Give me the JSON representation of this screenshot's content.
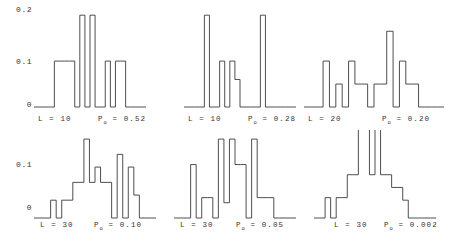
{
  "figure": {
    "background": "#ffffff",
    "line_color": "#3a3a3a",
    "rows": 2,
    "cols": 3
  },
  "axis": {
    "top_row_ticks": [
      "0.2",
      "0.1",
      "0"
    ],
    "bottom_row_ticks": [
      "0.1",
      "0"
    ]
  },
  "chart_data": {
    "type": "bar",
    "title": "",
    "xlabel": "",
    "ylabel": "",
    "grid": false,
    "legend": "none",
    "note": "Six step-histogram panels (2 rows x 3 columns) of a probability distribution; y axis shared per row, drawn as outline step curves.",
    "panels": [
      {
        "id": "panel-1",
        "position": "top-left",
        "L_label": "L = 10",
        "P_label": "P",
        "P_sub": "o",
        "P_value": "= 0.52",
        "ylim": [
          0,
          0.22
        ],
        "yticks": [
          0,
          0.1,
          0.2
        ],
        "nbins": 22,
        "values": [
          0,
          0,
          0,
          0,
          0.1,
          0.1,
          0.1,
          0.1,
          0,
          0.2,
          0,
          0.2,
          0,
          0,
          0.1,
          0,
          0.1,
          0.1,
          0,
          0,
          0,
          0
        ]
      },
      {
        "id": "panel-2",
        "position": "top-middle",
        "L_label": "L = 10",
        "P_label": "P",
        "P_sub": "o",
        "P_value": "= 0.28",
        "ylim": [
          0,
          0.22
        ],
        "yticks": [
          0,
          0.1,
          0.2
        ],
        "nbins": 22,
        "values": [
          0,
          0,
          0,
          0,
          0.2,
          0,
          0,
          0.1,
          0,
          0.1,
          0.06,
          0,
          0,
          0,
          0,
          0.2,
          0,
          0,
          0,
          0,
          0,
          0
        ]
      },
      {
        "id": "panel-3",
        "position": "top-right",
        "L_label": "L = 20",
        "P_label": "P",
        "P_sub": "o",
        "P_value": "= 0.20",
        "ylim": [
          0,
          0.22
        ],
        "yticks": [
          0,
          0.1,
          0.2
        ],
        "nbins": 22,
        "values": [
          0,
          0,
          0,
          0.1,
          0,
          0.05,
          0,
          0.1,
          0.05,
          0.05,
          0,
          0.05,
          0.05,
          0.165,
          0,
          0.1,
          0.05,
          0.05,
          0,
          0,
          0,
          0
        ]
      },
      {
        "id": "panel-4",
        "position": "bottom-left",
        "L_label": "L = 30",
        "P_label": "P",
        "P_sub": "o",
        "P_value": "= 0.10",
        "ylim": [
          0,
          0.165
        ],
        "yticks": [
          0,
          0.1
        ],
        "nbins": 22,
        "values": [
          0,
          0,
          0,
          0.035,
          0,
          0.035,
          0.035,
          0.07,
          0.07,
          0.155,
          0.07,
          0.1,
          0.07,
          0.07,
          0,
          0.125,
          0,
          0.1,
          0.045,
          0,
          0,
          0
        ]
      },
      {
        "id": "panel-5",
        "position": "bottom-middle",
        "L_label": "L = 30",
        "P_label": "P",
        "P_sub": "o",
        "P_value": "= 0.05",
        "ylim": [
          0,
          0.165
        ],
        "yticks": [
          0,
          0.1
        ],
        "nbins": 22,
        "values": [
          0,
          0,
          0,
          0.105,
          0,
          0.04,
          0.04,
          0,
          0.155,
          0.03,
          0.155,
          0.105,
          0.105,
          0,
          0.155,
          0.04,
          0.04,
          0.04,
          0,
          0,
          0,
          0
        ]
      },
      {
        "id": "panel-6",
        "position": "bottom-right",
        "L_label": "L = 30",
        "P_label": "P",
        "P_sub": "o",
        "P_value": "= 0.002",
        "ylim": [
          0,
          0.165
        ],
        "yticks": [
          0,
          0.1
        ],
        "nbins": 22,
        "values": [
          0,
          0,
          0.04,
          0,
          0.04,
          0.04,
          0.085,
          0.085,
          0.24,
          0.24,
          0.085,
          0.22,
          0.085,
          0.085,
          0.06,
          0.06,
          0.035,
          0,
          0,
          0,
          0,
          0
        ]
      }
    ]
  }
}
